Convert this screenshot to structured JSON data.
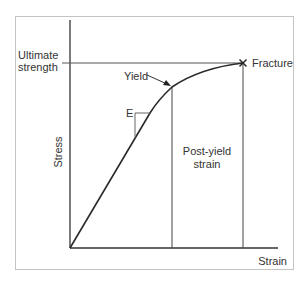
{
  "diagram": {
    "axes": {
      "x_label": "Strain",
      "y_label": "Stress"
    },
    "labels": {
      "ultimate_line1": "Ultimate",
      "ultimate_line2": "strength",
      "yield": "Yield",
      "fracture": "Fracture",
      "modulus": "E",
      "post_yield_line1": "Post-yield",
      "post_yield_line2": "strain"
    },
    "colors": {
      "frame": "#bdbdbd",
      "lines": "#333333",
      "text": "#333333"
    }
  }
}
